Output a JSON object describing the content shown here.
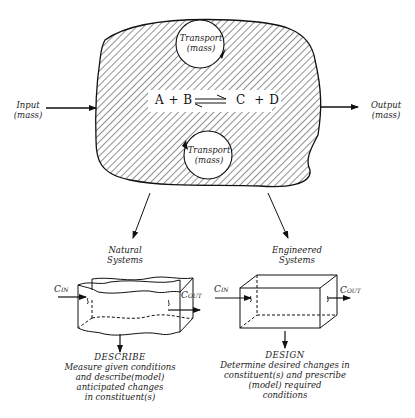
{
  "diagram": {
    "reactor": {
      "reaction": {
        "left": "A + B",
        "arrow": "⇌",
        "right": "C  + D"
      },
      "transport_top": {
        "line1": "Transport",
        "line2": "(mass)"
      },
      "transport_bottom": {
        "line1": "Transport",
        "line2": "(mass)"
      }
    },
    "input": {
      "line1": "Input",
      "line2": "(mass)"
    },
    "output": {
      "line1": "Output",
      "line2": "(mass)"
    },
    "branches": [
      {
        "title_line1": "Natural",
        "title_line2": "Systems",
        "c_in": "C",
        "c_in_sub": "IN",
        "c_out": "C",
        "c_out_sub": "OUT",
        "heading": "DESCRIBE",
        "desc": [
          "Measure given conditions",
          "and describe(model)",
          "anticipated changes",
          "in constituent(s)"
        ]
      },
      {
        "title_line1": "Engineered",
        "title_line2": "Systems",
        "c_in": "C",
        "c_in_sub": "IN",
        "c_out": "C",
        "c_out_sub": "OUT",
        "heading": "DESIGN",
        "desc": [
          "Determine desired changes in",
          "constituent(s) and prescribe",
          "(model) required",
          "conditions"
        ]
      }
    ]
  }
}
